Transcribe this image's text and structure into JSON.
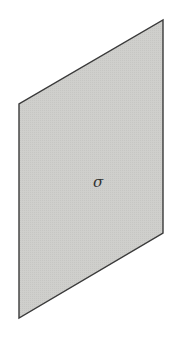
{
  "diagram": {
    "type": "plane",
    "label": "σ",
    "colors": {
      "fill": "#cfcfcc",
      "stroke": "#3a3a3a",
      "label": "#333333"
    }
  }
}
